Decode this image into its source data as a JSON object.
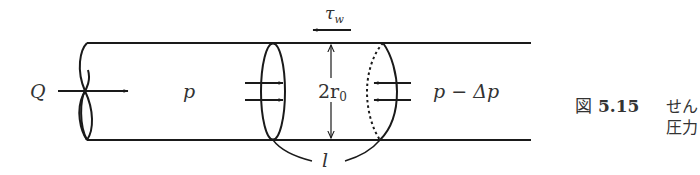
{
  "diagram": {
    "colors": {
      "stroke": "#1a1a1a",
      "text": "#333333",
      "background": "#ffffff"
    },
    "labels": {
      "flow": "Q",
      "pressure_in": "p",
      "pressure_out": "p − Δp",
      "diameter_main": "2r",
      "diameter_sub": "0",
      "wall_stress_main": "τ",
      "wall_stress_sub": "w",
      "length": "l"
    },
    "icons": {
      "flow_arrow": "arrow-right",
      "inlet_pressure_arrows": "arrow-right-pair",
      "outlet_pressure_arrows": "arrow-left-pair",
      "shear_arrow": "arrow-left",
      "diameter_dimension": "double-arrow-vertical"
    }
  },
  "caption": {
    "prefix": "図",
    "number": "5.15",
    "line1": "せん",
    "line2": "圧力"
  }
}
